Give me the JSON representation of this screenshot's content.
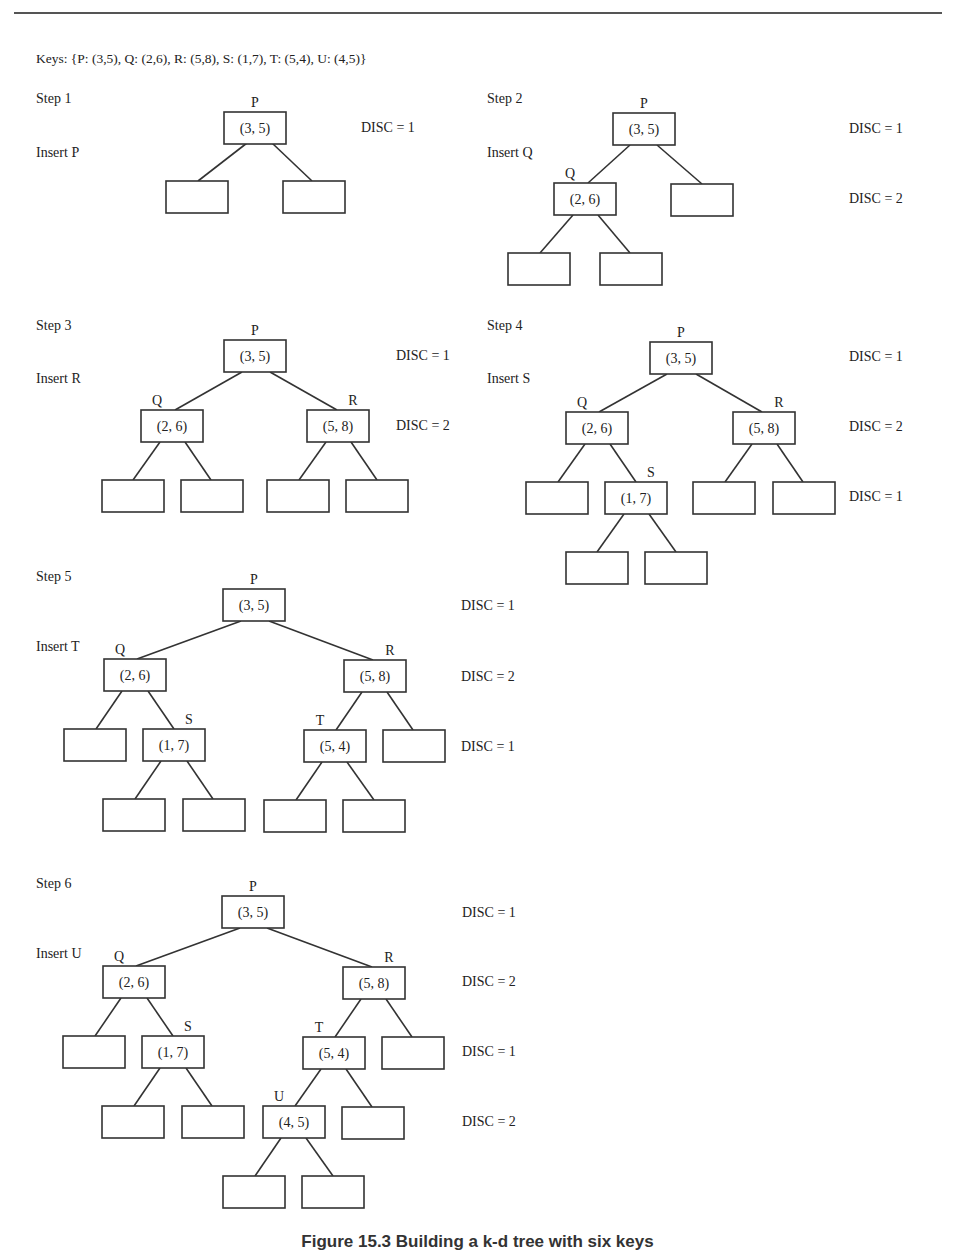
{
  "header": {
    "keys_line": "Keys: {P: (3,5), Q: (2,6), R: (5,8), S: (1,7), T: (5,4), U: (4,5)}"
  },
  "caption": "Figure 15.3 Building a k-d tree with six keys",
  "colors": {
    "line": "#333333",
    "text": "#222222",
    "background": "#ffffff"
  },
  "steps": [
    {
      "id": "step-1",
      "title": "Step 1",
      "action": "Insert P",
      "title_pos": [
        36,
        103
      ],
      "action_pos": [
        36,
        157
      ],
      "disc_labels": [
        {
          "text": "DISC = 1",
          "x": 361,
          "y": 132
        }
      ],
      "nodes": [
        {
          "id": "P",
          "label": "P",
          "value": "(3, 5)",
          "x": 224,
          "y": 112
        }
      ],
      "empty": [
        {
          "x": 166,
          "y": 181
        },
        {
          "x": 283,
          "y": 181
        }
      ],
      "edges": [
        [
          247,
          143,
          198,
          181
        ],
        [
          272,
          143,
          312,
          181
        ]
      ]
    },
    {
      "id": "step-2",
      "title": "Step 2",
      "action": "Insert Q",
      "title_pos": [
        487,
        103
      ],
      "action_pos": [
        487,
        157
      ],
      "disc_labels": [
        {
          "text": "DISC = 1",
          "x": 849,
          "y": 133
        },
        {
          "text": "DISC = 2",
          "x": 849,
          "y": 203
        }
      ],
      "nodes": [
        {
          "id": "P",
          "label": "P",
          "value": "(3, 5)",
          "x": 613,
          "y": 113
        },
        {
          "id": "Q",
          "label": "Q",
          "value": "(2, 6)",
          "x": 554,
          "y": 183
        }
      ],
      "empty": [
        {
          "x": 671,
          "y": 184
        },
        {
          "x": 508,
          "y": 253
        },
        {
          "x": 600,
          "y": 253
        }
      ],
      "edges": [
        [
          630,
          145,
          588,
          183
        ],
        [
          657,
          145,
          702,
          184
        ],
        [
          573,
          215,
          540,
          253
        ],
        [
          598,
          215,
          630,
          253
        ]
      ]
    },
    {
      "id": "step-3",
      "title": "Step 3",
      "action": "Insert R",
      "title_pos": [
        36,
        330
      ],
      "action_pos": [
        36,
        383
      ],
      "disc_labels": [
        {
          "text": "DISC = 1",
          "x": 396,
          "y": 360
        },
        {
          "text": "DISC = 2",
          "x": 396,
          "y": 430
        }
      ],
      "nodes": [
        {
          "id": "P",
          "label": "P",
          "value": "(3, 5)",
          "x": 224,
          "y": 340
        },
        {
          "id": "Q",
          "label": "Q",
          "value": "(2, 6)",
          "x": 141,
          "y": 410
        },
        {
          "id": "R",
          "label": "R",
          "value": "(5, 8)",
          "x": 307,
          "y": 410
        }
      ],
      "empty": [
        {
          "x": 102,
          "y": 480
        },
        {
          "x": 181,
          "y": 480
        },
        {
          "x": 267,
          "y": 480
        },
        {
          "x": 346,
          "y": 480
        }
      ],
      "edges": [
        [
          242,
          372,
          175,
          410
        ],
        [
          270,
          372,
          337,
          410
        ],
        [
          160,
          442,
          133,
          480
        ],
        [
          185,
          442,
          211,
          480
        ],
        [
          326,
          442,
          299,
          480
        ],
        [
          351,
          442,
          377,
          480
        ]
      ]
    },
    {
      "id": "step-4",
      "title": "Step 4",
      "action": "Insert S",
      "title_pos": [
        487,
        330
      ],
      "action_pos": [
        487,
        383
      ],
      "disc_labels": [
        {
          "text": "DISC = 1",
          "x": 849,
          "y": 361
        },
        {
          "text": "DISC = 2",
          "x": 849,
          "y": 431
        },
        {
          "text": "DISC = 1",
          "x": 849,
          "y": 501
        }
      ],
      "nodes": [
        {
          "id": "P",
          "label": "P",
          "value": "(3, 5)",
          "x": 650,
          "y": 342
        },
        {
          "id": "Q",
          "label": "Q",
          "value": "(2, 6)",
          "x": 566,
          "y": 412
        },
        {
          "id": "R",
          "label": "R",
          "value": "(5, 8)",
          "x": 733,
          "y": 412
        },
        {
          "id": "S",
          "label": "S",
          "value": "(1, 7)",
          "x": 605,
          "y": 482
        }
      ],
      "empty": [
        {
          "x": 526,
          "y": 482
        },
        {
          "x": 693,
          "y": 482
        },
        {
          "x": 773,
          "y": 482
        },
        {
          "x": 566,
          "y": 552
        },
        {
          "x": 645,
          "y": 552
        }
      ],
      "edges": [
        [
          667,
          374,
          599,
          412
        ],
        [
          696,
          374,
          762,
          412
        ],
        [
          585,
          444,
          558,
          482
        ],
        [
          610,
          444,
          636,
          482
        ],
        [
          752,
          444,
          725,
          482
        ],
        [
          777,
          444,
          803,
          482
        ],
        [
          624,
          514,
          597,
          552
        ],
        [
          649,
          514,
          676,
          552
        ]
      ]
    },
    {
      "id": "step-5",
      "title": "Step 5",
      "action": "Insert T",
      "title_pos": [
        36,
        581
      ],
      "action_pos": [
        36,
        651
      ],
      "disc_labels": [
        {
          "text": "DISC = 1",
          "x": 461,
          "y": 610
        },
        {
          "text": "DISC = 2",
          "x": 461,
          "y": 681
        },
        {
          "text": "DISC = 1",
          "x": 461,
          "y": 751
        }
      ],
      "nodes": [
        {
          "id": "P",
          "label": "P",
          "value": "(3, 5)",
          "x": 223,
          "y": 589
        },
        {
          "id": "Q",
          "label": "Q",
          "value": "(2, 6)",
          "x": 104,
          "y": 659
        },
        {
          "id": "R",
          "label": "R",
          "value": "(5, 8)",
          "x": 344,
          "y": 660
        },
        {
          "id": "S",
          "label": "S",
          "value": "(1, 7)",
          "x": 143,
          "y": 729
        },
        {
          "id": "T",
          "label": "T",
          "value": "(5, 4)",
          "x": 304,
          "y": 730
        }
      ],
      "empty": [
        {
          "x": 64,
          "y": 729
        },
        {
          "x": 383,
          "y": 730
        },
        {
          "x": 103,
          "y": 799
        },
        {
          "x": 183,
          "y": 799
        },
        {
          "x": 264,
          "y": 800
        },
        {
          "x": 343,
          "y": 800
        }
      ],
      "edges": [
        [
          241,
          621,
          137,
          659
        ],
        [
          269,
          621,
          373,
          660
        ],
        [
          122,
          691,
          96,
          729
        ],
        [
          148,
          691,
          174,
          729
        ],
        [
          362,
          692,
          336,
          730
        ],
        [
          387,
          692,
          413,
          730
        ],
        [
          161,
          761,
          135,
          799
        ],
        [
          187,
          761,
          213,
          799
        ],
        [
          322,
          762,
          296,
          800
        ],
        [
          347,
          762,
          374,
          800
        ]
      ]
    },
    {
      "id": "step-6",
      "title": "Step 6",
      "action": "Insert U",
      "title_pos": [
        36,
        888
      ],
      "action_pos": [
        36,
        958
      ],
      "disc_labels": [
        {
          "text": "DISC = 1",
          "x": 462,
          "y": 917
        },
        {
          "text": "DISC = 2",
          "x": 462,
          "y": 986
        },
        {
          "text": "DISC = 1",
          "x": 462,
          "y": 1056
        },
        {
          "text": "DISC = 2",
          "x": 462,
          "y": 1126
        }
      ],
      "nodes": [
        {
          "id": "P",
          "label": "P",
          "value": "(3, 5)",
          "x": 222,
          "y": 896
        },
        {
          "id": "Q",
          "label": "Q",
          "value": "(2, 6)",
          "x": 103,
          "y": 966
        },
        {
          "id": "R",
          "label": "R",
          "value": "(5, 8)",
          "x": 343,
          "y": 967
        },
        {
          "id": "S",
          "label": "S",
          "value": "(1, 7)",
          "x": 142,
          "y": 1036
        },
        {
          "id": "T",
          "label": "T",
          "value": "(5, 4)",
          "x": 303,
          "y": 1037
        },
        {
          "id": "U",
          "label": "U",
          "value": "(4, 5)",
          "x": 263,
          "y": 1106
        }
      ],
      "empty": [
        {
          "x": 63,
          "y": 1036
        },
        {
          "x": 382,
          "y": 1037
        },
        {
          "x": 102,
          "y": 1106
        },
        {
          "x": 182,
          "y": 1106
        },
        {
          "x": 342,
          "y": 1107
        },
        {
          "x": 223,
          "y": 1176
        },
        {
          "x": 302,
          "y": 1176
        }
      ],
      "edges": [
        [
          240,
          928,
          136,
          966
        ],
        [
          267,
          928,
          372,
          967
        ],
        [
          121,
          998,
          95,
          1036
        ],
        [
          147,
          998,
          173,
          1036
        ],
        [
          361,
          999,
          335,
          1037
        ],
        [
          386,
          999,
          412,
          1037
        ],
        [
          160,
          1068,
          134,
          1106
        ],
        [
          186,
          1068,
          212,
          1106
        ],
        [
          321,
          1069,
          295,
          1106
        ],
        [
          346,
          1069,
          372,
          1107
        ],
        [
          281,
          1138,
          255,
          1176
        ],
        [
          306,
          1138,
          333,
          1176
        ]
      ]
    }
  ]
}
